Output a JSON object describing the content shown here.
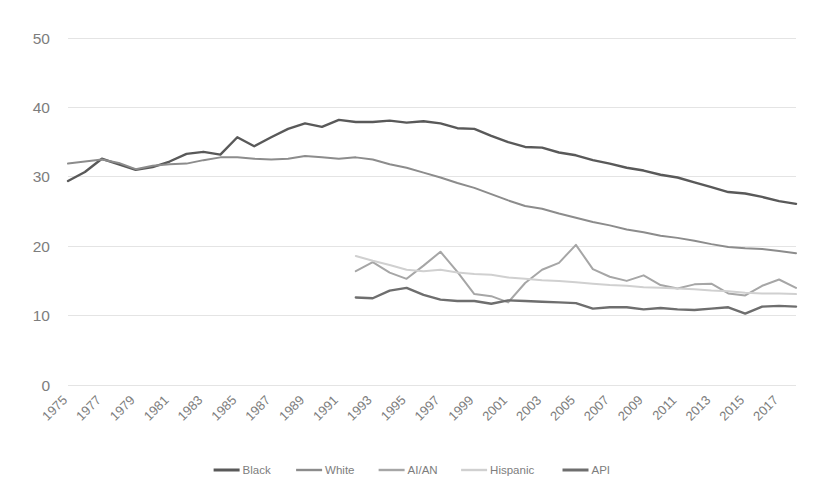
{
  "chart_data": {
    "type": "line",
    "title": "",
    "subtitle": "",
    "xlabel": "",
    "ylabel": "",
    "xlim": [
      1975,
      2018
    ],
    "ylim": [
      0,
      50
    ],
    "ytick_values": [
      0,
      10,
      20,
      30,
      40,
      50
    ],
    "ytick_labels": [
      "0",
      "10",
      "20",
      "30",
      "40",
      "50"
    ],
    "xtick_labels": [
      "1975",
      "1977",
      "1979",
      "1981",
      "1983",
      "1985",
      "1987",
      "1989",
      "1991",
      "1993",
      "1995",
      "1997",
      "1999",
      "2001",
      "2003",
      "2005",
      "2007",
      "2009",
      "2011",
      "2013",
      "2015",
      "2017"
    ],
    "xtick_values": [
      1975,
      1977,
      1979,
      1981,
      1983,
      1985,
      1987,
      1989,
      1991,
      1993,
      1995,
      1997,
      1999,
      2001,
      2003,
      2005,
      2007,
      2009,
      2011,
      2013,
      2015,
      2017
    ],
    "grid": true,
    "grid_axis": "y",
    "legend_position": "bottom",
    "x": [
      1975,
      1976,
      1977,
      1978,
      1979,
      1980,
      1981,
      1982,
      1983,
      1984,
      1985,
      1986,
      1987,
      1988,
      1989,
      1990,
      1991,
      1992,
      1993,
      1994,
      1995,
      1996,
      1997,
      1998,
      1999,
      2000,
      2001,
      2002,
      2003,
      2004,
      2005,
      2006,
      2007,
      2008,
      2009,
      2010,
      2011,
      2012,
      2013,
      2014,
      2015,
      2016,
      2017,
      2018
    ],
    "series": [
      {
        "name": "Black",
        "color": "#595959",
        "x": [
          1975,
          1976,
          1977,
          1978,
          1979,
          1980,
          1981,
          1982,
          1983,
          1984,
          1985,
          1986,
          1987,
          1988,
          1989,
          1990,
          1991,
          1992,
          1993,
          1994,
          1995,
          1996,
          1997,
          1998,
          1999,
          2000,
          2001,
          2002,
          2003,
          2004,
          2005,
          2006,
          2007,
          2008,
          2009,
          2010,
          2011,
          2012,
          2013,
          2014,
          2015,
          2016,
          2017,
          2018
        ],
        "values": [
          29.4,
          30.7,
          32.6,
          31.8,
          31.0,
          31.4,
          32.2,
          33.3,
          33.6,
          33.2,
          35.7,
          34.4,
          35.7,
          36.9,
          37.7,
          37.2,
          38.2,
          37.9,
          37.9,
          38.1,
          37.8,
          38.0,
          37.7,
          37.0,
          36.9,
          35.9,
          35.0,
          34.3,
          34.2,
          33.5,
          33.1,
          32.4,
          31.9,
          31.3,
          30.9,
          30.3,
          29.9,
          29.2,
          28.5,
          27.8,
          27.6,
          27.1,
          26.5,
          26.1
        ]
      },
      {
        "name": "White",
        "color": "#8c8c8c",
        "x": [
          1975,
          1976,
          1977,
          1978,
          1979,
          1980,
          1981,
          1982,
          1983,
          1984,
          1985,
          1986,
          1987,
          1988,
          1989,
          1990,
          1991,
          1992,
          1993,
          1994,
          1995,
          1996,
          1997,
          1998,
          1999,
          2000,
          2001,
          2002,
          2003,
          2004,
          2005,
          2006,
          2007,
          2008,
          2009,
          2010,
          2011,
          2012,
          2013,
          2014,
          2015,
          2016,
          2017,
          2018
        ],
        "values": [
          31.9,
          32.2,
          32.5,
          32.0,
          31.1,
          31.6,
          31.8,
          31.9,
          32.4,
          32.8,
          32.8,
          32.6,
          32.5,
          32.6,
          33.0,
          32.8,
          32.6,
          32.8,
          32.5,
          31.8,
          31.3,
          30.6,
          29.9,
          29.1,
          28.4,
          27.5,
          26.6,
          25.8,
          25.4,
          24.7,
          24.1,
          23.5,
          23.0,
          22.4,
          22.0,
          21.5,
          21.2,
          20.8,
          20.3,
          19.9,
          19.7,
          19.6,
          19.3,
          19.0
        ]
      },
      {
        "name": "AI/AN",
        "color": "#a6a6a6",
        "x": [
          1992,
          1993,
          1994,
          1995,
          1996,
          1997,
          1998,
          1999,
          2000,
          2001,
          2002,
          2003,
          2004,
          2005,
          2006,
          2007,
          2008,
          2009,
          2010,
          2011,
          2012,
          2013,
          2014,
          2015,
          2016,
          2017,
          2018
        ],
        "values": [
          16.4,
          17.7,
          16.2,
          15.3,
          17.2,
          19.2,
          16.3,
          13.1,
          12.8,
          11.9,
          14.7,
          16.6,
          17.6,
          20.2,
          16.7,
          15.6,
          15.0,
          15.8,
          14.4,
          13.9,
          14.5,
          14.6,
          13.2,
          12.9,
          14.3,
          15.2,
          14.0
        ]
      },
      {
        "name": "Hispanic",
        "color": "#d0d0d0",
        "x": [
          1992,
          1993,
          1994,
          1995,
          1996,
          1997,
          1998,
          1999,
          2000,
          2001,
          2002,
          2003,
          2004,
          2005,
          2006,
          2007,
          2008,
          2009,
          2010,
          2011,
          2012,
          2013,
          2014,
          2015,
          2016,
          2017,
          2018
        ],
        "values": [
          18.6,
          17.9,
          17.3,
          16.6,
          16.4,
          16.6,
          16.2,
          16.0,
          15.9,
          15.5,
          15.3,
          15.1,
          15.0,
          14.8,
          14.6,
          14.4,
          14.3,
          14.1,
          14.0,
          13.9,
          13.8,
          13.6,
          13.5,
          13.3,
          13.2,
          13.2,
          13.1
        ]
      },
      {
        "name": "API",
        "color": "#6e6e6e",
        "x": [
          1992,
          1993,
          1994,
          1995,
          1996,
          1997,
          1998,
          1999,
          2000,
          2001,
          2002,
          2003,
          2004,
          2005,
          2006,
          2007,
          2008,
          2009,
          2010,
          2011,
          2012,
          2013,
          2014,
          2015,
          2016,
          2017,
          2018
        ],
        "values": [
          12.6,
          12.5,
          13.6,
          14.0,
          13.0,
          12.3,
          12.1,
          12.1,
          11.7,
          12.2,
          12.1,
          12.0,
          11.9,
          11.8,
          11.0,
          11.2,
          11.2,
          10.9,
          11.1,
          10.9,
          10.8,
          11.0,
          11.2,
          10.3,
          11.3,
          11.4,
          11.3
        ]
      }
    ]
  },
  "legend": {
    "items": [
      {
        "label": "Black",
        "color": "#595959"
      },
      {
        "label": "White",
        "color": "#8c8c8c"
      },
      {
        "label": "AI/AN",
        "color": "#a6a6a6"
      },
      {
        "label": "Hispanic",
        "color": "#d0d0d0"
      },
      {
        "label": "API",
        "color": "#6e6e6e"
      }
    ]
  }
}
